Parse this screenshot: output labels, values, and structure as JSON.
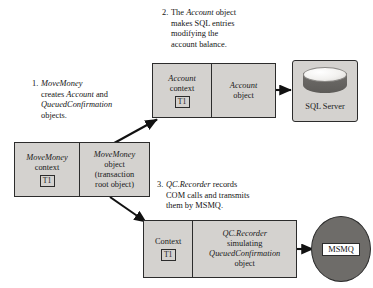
{
  "diagram": {
    "background_color": "#ffffff",
    "box_fill_color": "#d4d2cf",
    "box_border_color": "#2c2c2c",
    "node_dark_color": "#6e6c69"
  },
  "callouts": [
    {
      "number": "1.",
      "lines": [
        [
          {
            "t": "MoveMoney",
            "italic": true
          }
        ],
        [
          {
            "t": "creates ",
            "italic": false
          },
          {
            "t": "Account",
            "italic": true
          },
          {
            "t": " and",
            "italic": false
          }
        ],
        [
          {
            "t": "QueuedConfirmation",
            "italic": true
          }
        ],
        [
          {
            "t": "objects.",
            "italic": false
          }
        ]
      ]
    },
    {
      "number": "2.",
      "lines": [
        [
          {
            "t": "The ",
            "italic": false
          },
          {
            "t": "Account",
            "italic": true
          },
          {
            "t": " object",
            "italic": false
          }
        ],
        [
          {
            "t": "makes SQL entries",
            "italic": false
          }
        ],
        [
          {
            "t": "modifying the",
            "italic": false
          }
        ],
        [
          {
            "t": "account balance.",
            "italic": false
          }
        ]
      ]
    },
    {
      "number": "3.",
      "lines": [
        [
          {
            "t": "QC.Recorder",
            "italic": true
          },
          {
            "t": " records",
            "italic": false
          }
        ],
        [
          {
            "t": "COM calls and transmits",
            "italic": false
          }
        ],
        [
          {
            "t": "them by MSMQ.",
            "italic": false
          }
        ]
      ]
    }
  ],
  "boxes": {
    "move_money": {
      "name": "MoveMoney component",
      "context_cell": {
        "lines": [
          {
            "t": "MoveMoney",
            "italic": true
          },
          {
            "t": "context",
            "italic": false
          }
        ],
        "badge": "T1"
      },
      "object_cell": {
        "lines": [
          {
            "t": "MoveMoney",
            "italic": true
          },
          {
            "t": "object",
            "italic": false
          },
          {
            "t": "(transaction",
            "italic": false
          },
          {
            "t": "root object)",
            "italic": false
          }
        ]
      }
    },
    "account": {
      "name": "Account component",
      "context_cell": {
        "lines": [
          {
            "t": "Account",
            "italic": true
          },
          {
            "t": "context",
            "italic": false
          }
        ],
        "badge": "T1"
      },
      "object_cell": {
        "lines": [
          {
            "t": "Account",
            "italic": true
          },
          {
            "t": "object",
            "italic": false
          }
        ]
      }
    },
    "qc_recorder": {
      "name": "QC.Recorder component",
      "context_cell": {
        "lines": [
          {
            "t": "Context",
            "italic": false
          }
        ],
        "badge": "T1"
      },
      "object_cell": {
        "lines": [
          {
            "t": "QC.Recorder",
            "italic": true
          },
          {
            "t": "simulating",
            "italic": false
          },
          {
            "t": "QueuedConfirmation",
            "italic": true
          },
          {
            "t": "object",
            "italic": false
          }
        ]
      }
    }
  },
  "nodes": {
    "sql_server": {
      "label": "SQL Server",
      "icon": "database-cylinder-icon"
    },
    "msmq": {
      "label": "MSMQ",
      "icon": "queue-ellipse-icon"
    }
  },
  "arrows": [
    {
      "name": "arrow-movemoney-to-account",
      "from": "MoveMoney object",
      "to": "Account context"
    },
    {
      "name": "arrow-movemoney-to-qcrecorder",
      "from": "MoveMoney object",
      "to": "QC.Recorder context"
    },
    {
      "name": "arrow-account-to-sqlserver",
      "from": "Account object",
      "to": "SQL Server"
    },
    {
      "name": "arrow-qcrecorder-to-msmq",
      "from": "QC.Recorder object",
      "to": "MSMQ"
    }
  ]
}
